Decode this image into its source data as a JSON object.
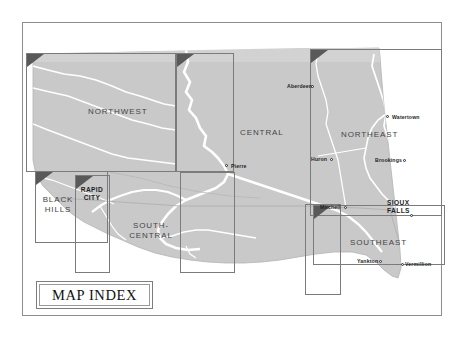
{
  "document": {
    "title": "MAP INDEX",
    "type": "state map index sheet",
    "state": "South Dakota"
  },
  "index_plate": {
    "label": "MAP INDEX"
  },
  "colors": {
    "state_fill": "#c9c9c9",
    "state_fill_light": "#d6d6d6",
    "page_background": "#ffffff",
    "frame_border": "#8d8d8d",
    "inset_border": "#7b7b7b",
    "inset_corner_triangle": "#595959",
    "river": "#ffffff",
    "road": "#b0b0b0",
    "label_text": "#454545",
    "city_text": "#1f1f1f"
  },
  "regions": [
    {
      "id": "northwest",
      "label": "NORTHWEST"
    },
    {
      "id": "central",
      "label": "CENTRAL"
    },
    {
      "id": "northeast",
      "label": "NORTHEAST"
    },
    {
      "id": "southeast",
      "label": "SOUTHEAST"
    },
    {
      "id": "black-hills",
      "label_line1": "BLACK",
      "label_line2": "HILLS"
    },
    {
      "id": "south-central",
      "label_line1": "SOUTH-",
      "label_line2": "CENTRAL"
    },
    {
      "id": "rapid-city",
      "label_line1": "RAPID",
      "label_line2": "CITY"
    },
    {
      "id": "sioux-falls",
      "label_line1": "SIOUX",
      "label_line2": "FALLS"
    }
  ],
  "cities": [
    {
      "id": "aberdeen",
      "name": "Aberdeen",
      "marker": "right"
    },
    {
      "id": "pierre",
      "name": "Pierre",
      "marker": "left"
    },
    {
      "id": "huron",
      "name": "Huron",
      "marker": "right"
    },
    {
      "id": "watertown",
      "name": "Watertown",
      "marker": "left"
    },
    {
      "id": "brookings",
      "name": "Brookings",
      "marker": "right"
    },
    {
      "id": "mitchell",
      "name": "Mitchell",
      "marker": "right"
    },
    {
      "id": "sioux-falls",
      "name": "SIOUX FALLS",
      "marker": "right"
    },
    {
      "id": "yankton",
      "name": "Yankton",
      "marker": "right"
    },
    {
      "id": "vermillion",
      "name": "Vermillion",
      "marker": "left"
    }
  ],
  "insets": [
    {
      "id": "northwest",
      "corner_marker": "triangle-top-left"
    },
    {
      "id": "central",
      "corner_marker": "triangle-top-left"
    },
    {
      "id": "northeast",
      "corner_marker": "triangle-top-left"
    },
    {
      "id": "black-hills",
      "corner_marker": "triangle-top-left"
    },
    {
      "id": "rapid-city",
      "corner_marker": "triangle-top-left"
    },
    {
      "id": "south-central",
      "corner_marker": "none"
    },
    {
      "id": "mitchell",
      "corner_marker": "none"
    },
    {
      "id": "southeast",
      "corner_marker": "triangle-top-left"
    }
  ]
}
